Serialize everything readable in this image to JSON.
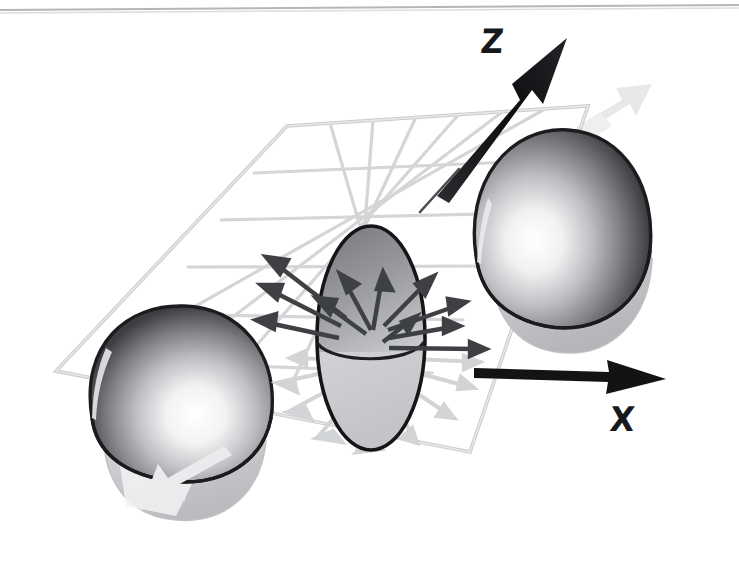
{
  "figure": {
    "domain": "scientific-diagram",
    "background_color": "#ffffff",
    "top_rule": {
      "name": "page-scan-rule",
      "color": "#b4b6b9",
      "y_left": 9,
      "y_right": 5,
      "thickness": 2
    }
  },
  "axes": {
    "z": {
      "label": "Z",
      "label_x": 481,
      "label_y": 26,
      "color": "#111214",
      "shaft_from": [
        443,
        190
      ],
      "shaft_to": [
        565,
        40
      ],
      "style": "spindle-arrow",
      "sub_line": {
        "from": [
          443,
          190
        ],
        "to": [
          459,
          170
        ],
        "color": "#3b3d40"
      }
    },
    "x": {
      "label": "X",
      "label_x": 610,
      "label_y": 403,
      "color": "#111214",
      "shaft_from": [
        477,
        372
      ],
      "shaft_to": [
        664,
        379
      ],
      "style": "spindle-arrow"
    }
  },
  "grid_plane": {
    "name": "xy-grid-plane",
    "line_color": "#d4d5d7",
    "line_color_strong": "#c5c7c9",
    "line_width": 3.2,
    "columns": 7,
    "rows": 6,
    "corners": {
      "top_left": [
        287,
        126
      ],
      "top_right": [
        588,
        106
      ],
      "bottom_right": [
        470,
        452
      ],
      "bottom_left": [
        56,
        371
      ]
    }
  },
  "objects": [
    {
      "name": "left-lobe",
      "type": "cut-sphere",
      "center": [
        183,
        410
      ],
      "radius_x": 96,
      "radius_y": 92,
      "outline_color": "#1b1c1e",
      "shell_dark": "#4a4c4f",
      "core_light": "#ffffff",
      "skirt_color": "#c8cacc",
      "cut": "lower-right quadrant removed"
    },
    {
      "name": "center-lobe",
      "type": "prolate-ellipsoid",
      "center": [
        371,
        338
      ],
      "radius_x": 54,
      "radius_y": 112,
      "outline_color": "#141517",
      "upper_fill_dark": "#6f7174",
      "upper_fill_light": "#d7d8da",
      "lower_fill": "#cfd1d3",
      "plane_cut_y": 352
    },
    {
      "name": "right-lobe",
      "type": "cut-sphere",
      "center": [
        556,
        230
      ],
      "radius_x": 96,
      "radius_y": 92,
      "outline_color": "#1b1c1e",
      "shell_dark": "#4a4c4f",
      "core_light": "#ffffff",
      "skirt_color": "#c3c5c8",
      "cut": "lower-left quadrant removed"
    }
  ],
  "vectors": {
    "origin": [
      371,
      330
    ],
    "above_plane": {
      "name": "radiating-vectors-above",
      "color": "#3e4043",
      "count": 11,
      "head_length": 17,
      "shaft_width": 4.4,
      "tips": [
        [
          261,
          256
        ],
        [
          258,
          285
        ],
        [
          253,
          318
        ],
        [
          337,
          274
        ],
        [
          375,
          268
        ],
        [
          312,
          298
        ],
        [
          421,
          276
        ],
        [
          453,
          302
        ],
        [
          447,
          324
        ],
        [
          472,
          345
        ],
        [
          409,
          318
        ]
      ]
    },
    "below_plane": {
      "name": "radiating-vectors-below",
      "color": "#d2d4d6",
      "count": 9,
      "head_length": 16,
      "shaft_width": 4.2,
      "tips": [
        [
          272,
          358
        ],
        [
          256,
          382
        ],
        [
          268,
          414
        ],
        [
          299,
          440
        ],
        [
          340,
          455
        ],
        [
          401,
          446
        ],
        [
          440,
          420
        ],
        [
          462,
          390
        ],
        [
          470,
          364
        ]
      ]
    }
  },
  "ghost_arrows": [
    {
      "name": "ghost-arrow-top-right",
      "from": [
        584,
        110
      ],
      "to": [
        636,
        82
      ],
      "color": "#e2e3e5"
    },
    {
      "name": "ghost-arrow-bottom-left",
      "from": [
        190,
        463
      ],
      "to": [
        108,
        503
      ],
      "color": "#e0e1e3"
    }
  ]
}
